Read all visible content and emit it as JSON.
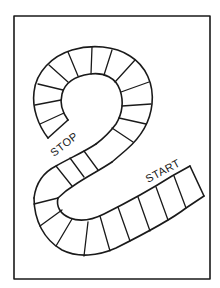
{
  "board": {
    "type": "game-board-path",
    "labels": {
      "stop": "STOP",
      "start": "START"
    },
    "colors": {
      "ink": "#1a1a1a",
      "background": "#ffffff"
    }
  }
}
